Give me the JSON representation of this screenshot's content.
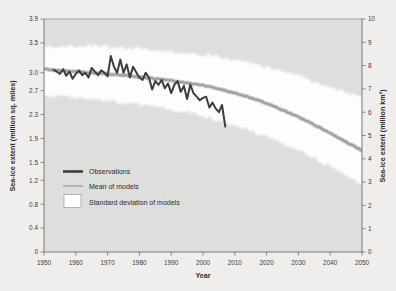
{
  "figure": {
    "background_color": "#f0eeec",
    "plot_background_color": "#dededc"
  },
  "chart_data": {
    "type": "line",
    "title": "",
    "subtitle": "",
    "xlabel": "Year",
    "ylabel": "Sea-ice extent (million sq. miles)",
    "ylabel_right": "Sea-ice extent (million km²)",
    "xlim": [
      1950,
      2050
    ],
    "xticks": [
      1950,
      1960,
      1970,
      1980,
      1990,
      2000,
      2010,
      2020,
      2030,
      2040,
      2050
    ],
    "xtick_labels": [
      "1950",
      "1960",
      "1970",
      "1980",
      "1990",
      "2000",
      "2010",
      "2020",
      "2030",
      "2040",
      "2050"
    ],
    "ylim": [
      0,
      3.9
    ],
    "yticks": [
      0,
      0.4,
      0.8,
      1.2,
      1.5,
      1.9,
      2.3,
      2.7,
      3.0,
      3.5,
      3.9
    ],
    "ytick_labels": [
      "0",
      "0.4",
      "0.8",
      "1.2",
      "1.5",
      "1.9",
      "2.3",
      "2.7",
      "3.0",
      "3.5",
      "3.9"
    ],
    "ylim_right": [
      0,
      10
    ],
    "yticks_right": [
      0,
      1,
      2,
      3,
      4,
      5,
      6,
      7,
      8,
      9,
      10
    ],
    "ytick_labels_right": [
      "0",
      "1",
      "2",
      "3",
      "4",
      "5",
      "6",
      "7",
      "8",
      "9",
      "10"
    ],
    "grid": false,
    "legend_position": "lower-left-inside",
    "legend": [
      {
        "label": "Observations",
        "marker": "thick-dark-line",
        "color": "#3d3d3d"
      },
      {
        "label": "Mean of models",
        "marker": "thin-gray-line",
        "color": "#a8a8a6"
      },
      {
        "label": "Standard deviation of models",
        "marker": "white-filled-box",
        "color": "#ffffff"
      }
    ],
    "units_note": "Left axis in million sq. miles; right axis in million km² (1 million sq. miles ≈ 2.59 million km²)",
    "series": [
      {
        "name": "Observations",
        "color": "#3d3d3d",
        "x_start": 1953,
        "x_end": 2007,
        "x": [
          1953,
          1954,
          1955,
          1956,
          1957,
          1958,
          1959,
          1960,
          1961,
          1962,
          1963,
          1964,
          1965,
          1966,
          1967,
          1968,
          1969,
          1970,
          1971,
          1972,
          1973,
          1974,
          1975,
          1976,
          1977,
          1978,
          1979,
          1980,
          1981,
          1982,
          1983,
          1984,
          1985,
          1986,
          1987,
          1988,
          1989,
          1990,
          1991,
          1992,
          1993,
          1994,
          1995,
          1996,
          1997,
          1998,
          1999,
          2000,
          2001,
          2002,
          2003,
          2004,
          2005,
          2006,
          2007
        ],
        "values": [
          3.05,
          3.02,
          2.98,
          3.06,
          2.95,
          3.02,
          2.9,
          2.98,
          3.04,
          2.96,
          3.0,
          2.92,
          3.08,
          3.02,
          2.96,
          3.04,
          3.0,
          2.94,
          3.28,
          3.1,
          3.0,
          3.22,
          3.0,
          3.14,
          2.92,
          3.1,
          3.01,
          2.92,
          2.88,
          3.0,
          2.92,
          2.72,
          2.86,
          2.8,
          2.88,
          2.74,
          2.82,
          2.66,
          2.8,
          2.86,
          2.68,
          2.78,
          2.56,
          2.8,
          2.66,
          2.6,
          2.54,
          2.58,
          2.6,
          2.42,
          2.5,
          2.4,
          2.34,
          2.46,
          2.1
        ]
      },
      {
        "name": "Mean of models",
        "color": "#a8a8a6",
        "x_start": 1950,
        "x_end": 2050,
        "x": [
          1950,
          1955,
          1960,
          1965,
          1970,
          1975,
          1980,
          1985,
          1990,
          1995,
          2000,
          2005,
          2010,
          2015,
          2020,
          2025,
          2030,
          2035,
          2040,
          2045,
          2050
        ],
        "values": [
          3.06,
          3.04,
          3.02,
          3.0,
          2.98,
          2.96,
          2.93,
          2.9,
          2.87,
          2.83,
          2.79,
          2.73,
          2.66,
          2.58,
          2.49,
          2.38,
          2.26,
          2.13,
          1.99,
          1.84,
          1.7
        ]
      }
    ],
    "band": {
      "name": "Standard deviation of models",
      "color": "#ffffff",
      "x": [
        1950,
        1955,
        1960,
        1965,
        1970,
        1975,
        1980,
        1985,
        1990,
        1995,
        2000,
        2005,
        2010,
        2015,
        2020,
        2025,
        2030,
        2035,
        2040,
        2045,
        2050
      ],
      "upper": [
        3.42,
        3.45,
        3.43,
        3.46,
        3.44,
        3.42,
        3.4,
        3.37,
        3.36,
        3.33,
        3.3,
        3.26,
        3.22,
        3.16,
        3.1,
        3.02,
        2.94,
        2.85,
        2.76,
        2.67,
        2.58
      ],
      "lower": [
        2.62,
        2.6,
        2.58,
        2.56,
        2.53,
        2.5,
        2.47,
        2.43,
        2.38,
        2.33,
        2.27,
        2.2,
        2.12,
        2.03,
        1.93,
        1.82,
        1.7,
        1.57,
        1.43,
        1.28,
        1.12
      ]
    }
  }
}
